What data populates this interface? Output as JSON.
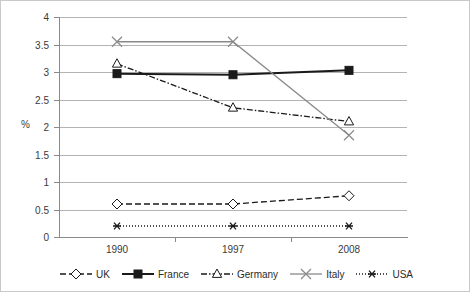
{
  "chart_data": {
    "type": "line",
    "title": "",
    "xlabel": "",
    "ylabel": "%",
    "categories": [
      "1990",
      "1997",
      "2008"
    ],
    "ylim": [
      0,
      4
    ],
    "ytick_labels": [
      "0",
      "0.5",
      "1",
      "1.5",
      "2",
      "2.5",
      "3",
      "3.5",
      "4"
    ],
    "ytick_values": [
      0,
      0.5,
      1,
      1.5,
      2,
      2.5,
      3,
      3.5,
      4
    ],
    "grid": true,
    "legend_position": "bottom",
    "series": [
      {
        "name": "UK",
        "values": [
          0.6,
          0.6,
          0.75
        ],
        "marker": "diamond-open",
        "line_style": "dashed",
        "color": "#1a1a1a"
      },
      {
        "name": "France",
        "values": [
          2.97,
          2.95,
          3.03
        ],
        "marker": "square-filled",
        "line_style": "solid",
        "color": "#1a1a1a"
      },
      {
        "name": "Germany",
        "values": [
          3.15,
          2.35,
          2.1
        ],
        "marker": "triangle-open",
        "line_style": "dash-dot",
        "color": "#1a1a1a"
      },
      {
        "name": "Italy",
        "values": [
          3.55,
          3.55,
          1.85
        ],
        "marker": "cross-x",
        "line_style": "solid",
        "color": "#8a8a8a"
      },
      {
        "name": "USA",
        "values": [
          0.2,
          0.2,
          0.2
        ],
        "marker": "asterisk",
        "line_style": "dotted",
        "color": "#1a1a1a"
      }
    ]
  },
  "legend": {
    "items": [
      {
        "label": "UK"
      },
      {
        "label": "France"
      },
      {
        "label": "Germany"
      },
      {
        "label": "Italy"
      },
      {
        "label": "USA"
      }
    ]
  }
}
